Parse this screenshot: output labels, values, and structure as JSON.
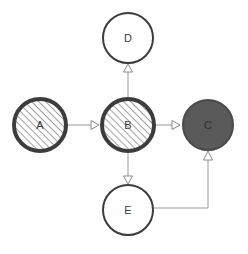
{
  "diagram": {
    "background_color": "#fefefe",
    "canvas": {
      "width": 248,
      "height": 254
    },
    "styles": {
      "hatched": {
        "border_color": "#3c3c3c",
        "border_width": 4,
        "fill": "#ffffff",
        "hatch_color": "#8a8a8a",
        "hatch_angle_deg": 45,
        "hatch_spacing": 5
      },
      "solid_dark": {
        "border_color": "#4a4a4a",
        "border_width": 2,
        "fill": "#5a5a5a"
      },
      "outline": {
        "border_color": "#3c3c3c",
        "border_width": 2,
        "fill": "#ffffff"
      }
    },
    "edge_style": {
      "line_color": "#9a9a9a",
      "line_width": 1,
      "arrowhead": "hollow-triangle",
      "arrowhead_fill": "#ffffff",
      "arrowhead_stroke": "#8a8a8a"
    },
    "nodes": [
      {
        "id": "A",
        "label": "A",
        "cx": 40,
        "cy": 125,
        "r": 28,
        "style": "hatched",
        "label_color": "#3a3a3a"
      },
      {
        "id": "B",
        "label": "B",
        "cx": 128,
        "cy": 125,
        "r": 28,
        "style": "hatched",
        "label_color": "#3a3a3a"
      },
      {
        "id": "C",
        "label": "C",
        "cx": 208,
        "cy": 125,
        "r": 26,
        "style": "solid_dark",
        "label_color": "#2e2e2e"
      },
      {
        "id": "D",
        "label": "D",
        "cx": 128,
        "cy": 38,
        "r": 26,
        "style": "outline",
        "label_color": "#3a3a3a"
      },
      {
        "id": "E",
        "label": "E",
        "cx": 128,
        "cy": 210,
        "r": 26,
        "style": "outline",
        "label_color": "#3a3a3a"
      }
    ],
    "edges": [
      {
        "id": "A-B",
        "from": "A",
        "to": "B",
        "direction": "right",
        "routing": "straight"
      },
      {
        "id": "B-C",
        "from": "B",
        "to": "C",
        "direction": "right",
        "routing": "straight"
      },
      {
        "id": "B-D",
        "from": "B",
        "to": "D",
        "direction": "up",
        "routing": "straight"
      },
      {
        "id": "B-E",
        "from": "B",
        "to": "E",
        "direction": "down",
        "routing": "straight"
      },
      {
        "id": "E-C",
        "from": "E",
        "to": "C",
        "direction": "up",
        "routing": "orthogonal",
        "corner_x": 208,
        "corner_y": 208
      }
    ]
  }
}
